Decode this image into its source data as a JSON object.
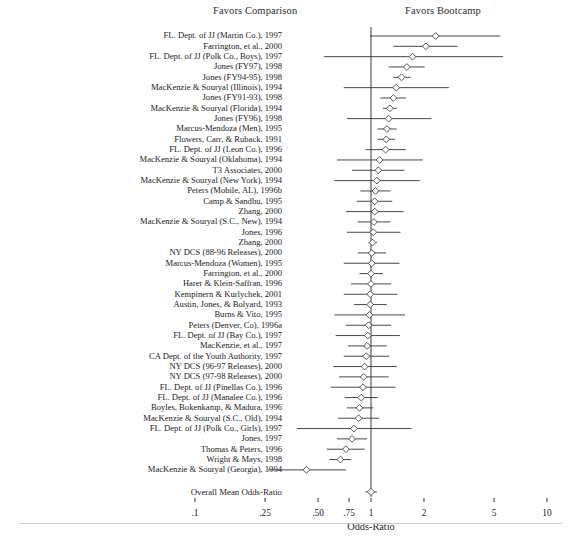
{
  "header": {
    "left_label": "Favors Comparison",
    "right_label": "Favors Bootcamp"
  },
  "axis": {
    "title": "Odds-Ratio",
    "tick_labels": [
      ".1",
      ".25",
      ".50",
      ".75",
      "1",
      "2",
      "5",
      "10"
    ],
    "tick_values": [
      0.1,
      0.25,
      0.5,
      0.75,
      1,
      2,
      5,
      10
    ],
    "reference_line": 1
  },
  "overall": {
    "label": "Overall Mean Odds-Ratio",
    "estimate": 1.0,
    "ci_low": 0.93,
    "ci_high": 1.08
  },
  "chart_data": {
    "type": "scatter",
    "title": "",
    "subtitle": "",
    "xlabel": "Odds-Ratio",
    "ylabel": "",
    "xscale": "log",
    "xlim": [
      0.1,
      10
    ],
    "grid": false,
    "legend": "none",
    "annotations": [
      "Favors Comparison",
      "Favors Bootcamp"
    ],
    "categories": [
      "FL. Dept. of JJ (Martin Co.), 1997",
      "Farrington, et al., 2000",
      "FL. Dept. of JJ (Polk Co., Boys), 1997",
      "Jones (FY97), 1998",
      "Jones (FY94-95), 1998",
      "MacKenzie & Souryal (Illinois), 1994",
      "Jones (FY91-93), 1998",
      "MacKenzie & Souryal (Florida), 1994",
      "Jones (FY96), 1998",
      "Marcus-Mendoza (Men), 1995",
      "Flowers, Carr, & Ruback, 1991",
      "FL. Dept. of JJ (Leon Co.), 1996",
      "MacKenzie & Souryal (Oklahoma), 1994",
      "T3 Associates, 2000",
      "MacKenzie & Souryal (New York), 1994",
      "Peters (Mobile, AL), 1996b",
      "Camp & Sandhu, 1995",
      "Zhang, 2000",
      "MacKenzie & Souryal (S.C., New), 1994",
      "Jones, 1996",
      "Zhang, 2000",
      "NY DCS (88-96 Releases), 2000",
      "Marcus-Mendoza (Women), 1995",
      "Farrington, et al., 2000",
      "Harer & Klein-Saffran, 1996",
      "Kempinern & Kurlychek, 2001",
      "Austin, Jones, & Bolyard, 1993",
      "Burns & Vito, 1995",
      "Peters (Denver, Co), 1996a",
      "FL. Dept. of JJ (Bay Co.), 1997",
      "MacKenzie, et al., 1997",
      "CA Dept. of the Youth Authority, 1997",
      "NY DCS (96-97 Releases), 2000",
      "NY DCS (97-98 Releases), 2000",
      "FL. Dept. of JJ (Pinellas Co.), 1996",
      "FL. Dept. of JJ (Manalee Co.), 1996",
      "Boyles, Bokenkamp, & Madura, 1996",
      "MacKenzie & Souryal (S.C., Old), 1994",
      "FL. Dept. of JJ (Polk Co., Girls), 1997",
      "Jones, 1997",
      "Thomas & Peters, 1996",
      "Wright & Mays, 1998",
      "MacKenzie & Souryal (Georgia), 1994"
    ],
    "estimates": [
      2.33,
      2.05,
      1.72,
      1.6,
      1.49,
      1.39,
      1.34,
      1.28,
      1.26,
      1.23,
      1.22,
      1.21,
      1.12,
      1.1,
      1.08,
      1.06,
      1.05,
      1.05,
      1.04,
      1.03,
      1.02,
      1.01,
      1.01,
      1.0,
      1.0,
      0.99,
      0.99,
      0.98,
      0.97,
      0.96,
      0.95,
      0.94,
      0.92,
      0.91,
      0.9,
      0.88,
      0.86,
      0.85,
      0.8,
      0.78,
      0.72,
      0.67,
      0.43
    ],
    "ci_low": [
      0.99,
      1.34,
      0.54,
      1.26,
      1.34,
      0.7,
      1.13,
      1.17,
      0.73,
      1.09,
      1.09,
      0.93,
      0.64,
      0.78,
      0.62,
      0.87,
      0.83,
      0.72,
      0.84,
      0.73,
      0.97,
      0.84,
      0.7,
      0.86,
      0.77,
      0.7,
      0.8,
      0.62,
      0.72,
      0.63,
      0.74,
      0.7,
      0.61,
      0.66,
      0.59,
      0.71,
      0.73,
      0.65,
      0.38,
      0.64,
      0.56,
      0.58,
      0.26
    ],
    "ci_high": [
      5.42,
      3.1,
      5.63,
      2.02,
      1.68,
      2.77,
      1.58,
      1.4,
      2.2,
      1.4,
      1.37,
      1.58,
      1.97,
      1.55,
      1.89,
      1.29,
      1.32,
      1.53,
      1.29,
      1.47,
      1.08,
      1.22,
      1.45,
      1.17,
      1.3,
      1.41,
      1.23,
      1.56,
      1.3,
      1.46,
      1.23,
      1.27,
      1.4,
      1.26,
      1.38,
      1.09,
      1.03,
      1.11,
      1.7,
      0.95,
      0.92,
      0.77,
      0.72
    ]
  }
}
